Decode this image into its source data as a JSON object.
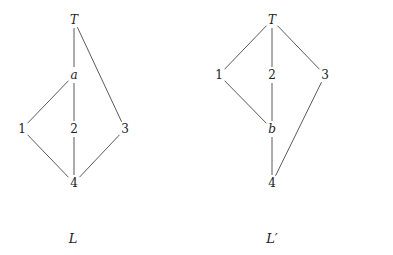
{
  "diagrams": [
    {
      "id": "L",
      "caption": "L",
      "nodes": [
        {
          "id": "T",
          "label": "T",
          "italic": true
        },
        {
          "id": "a",
          "label": "a",
          "italic": true
        },
        {
          "id": "1",
          "label": "1",
          "italic": false
        },
        {
          "id": "2",
          "label": "2",
          "italic": false
        },
        {
          "id": "3",
          "label": "3",
          "italic": false
        },
        {
          "id": "4",
          "label": "4",
          "italic": false
        }
      ],
      "edges": [
        [
          "T",
          "a"
        ],
        [
          "T",
          "3"
        ],
        [
          "a",
          "1"
        ],
        [
          "a",
          "2"
        ],
        [
          "1",
          "4"
        ],
        [
          "2",
          "4"
        ],
        [
          "3",
          "4"
        ]
      ]
    },
    {
      "id": "L-prime",
      "caption": "L′",
      "nodes": [
        {
          "id": "T",
          "label": "T",
          "italic": true
        },
        {
          "id": "1",
          "label": "1",
          "italic": false
        },
        {
          "id": "2",
          "label": "2",
          "italic": false
        },
        {
          "id": "3",
          "label": "3",
          "italic": false
        },
        {
          "id": "b",
          "label": "b",
          "italic": true
        },
        {
          "id": "4",
          "label": "4",
          "italic": false
        }
      ],
      "edges": [
        [
          "T",
          "1"
        ],
        [
          "T",
          "2"
        ],
        [
          "T",
          "3"
        ],
        [
          "1",
          "b"
        ],
        [
          "2",
          "b"
        ],
        [
          "b",
          "4"
        ],
        [
          "3",
          "4"
        ]
      ]
    }
  ]
}
